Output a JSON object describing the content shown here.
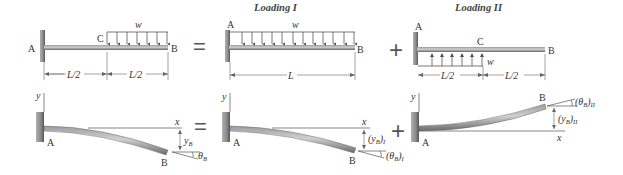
{
  "titles": {
    "loading1": "Loading I",
    "loading2": "Loading II"
  },
  "operators": {
    "top_equals": "=",
    "top_plus": "+",
    "bottom_equals": "=",
    "bottom_plus": "+"
  },
  "panel_original": {
    "support_label": "A",
    "point_c": "C",
    "point_b": "B",
    "load_label": "w",
    "dim_left": "L/2",
    "dim_right": "L/2",
    "load_direction": "downward",
    "load_extent": "C to B"
  },
  "panel_loading1": {
    "support_label": "A",
    "point_b": "B",
    "load_label": "w",
    "dim": "L",
    "load_direction": "downward",
    "load_extent": "A to B"
  },
  "panel_loading2": {
    "support_label": "A",
    "point_c": "C",
    "point_b": "B",
    "load_label": "w",
    "dim_left": "L/2",
    "dim_right": "L/2",
    "load_direction": "upward",
    "load_extent": "A to C"
  },
  "deflected_original": {
    "y_axis": "y",
    "x_axis": "x",
    "point_a": "A",
    "point_b": "B",
    "deflection": "y",
    "deflection_sub": "B",
    "slope": "θ",
    "slope_sub": "B"
  },
  "deflected_loading1": {
    "y_axis": "y",
    "x_axis": "x",
    "point_a": "A",
    "point_b": "B",
    "deflection": "(y",
    "deflection_sub": "B",
    "deflection_close": ")",
    "deflection_case": "I",
    "slope": "(θ",
    "slope_sub": "B",
    "slope_close": ")",
    "slope_case": "I"
  },
  "deflected_loading2": {
    "y_axis": "y",
    "x_axis": "x",
    "point_a": "A",
    "point_b": "B",
    "deflection": "(y",
    "deflection_sub": "B",
    "deflection_close": ")",
    "deflection_case": "II",
    "slope": "(θ",
    "slope_sub": "B",
    "slope_close": ")",
    "slope_case": "II"
  },
  "colors": {
    "wall": "#8a8a8a",
    "beam": "#7a7a7a",
    "beam_highlight": "#c8c8c8",
    "lines": "#555555",
    "text": "#333333"
  }
}
